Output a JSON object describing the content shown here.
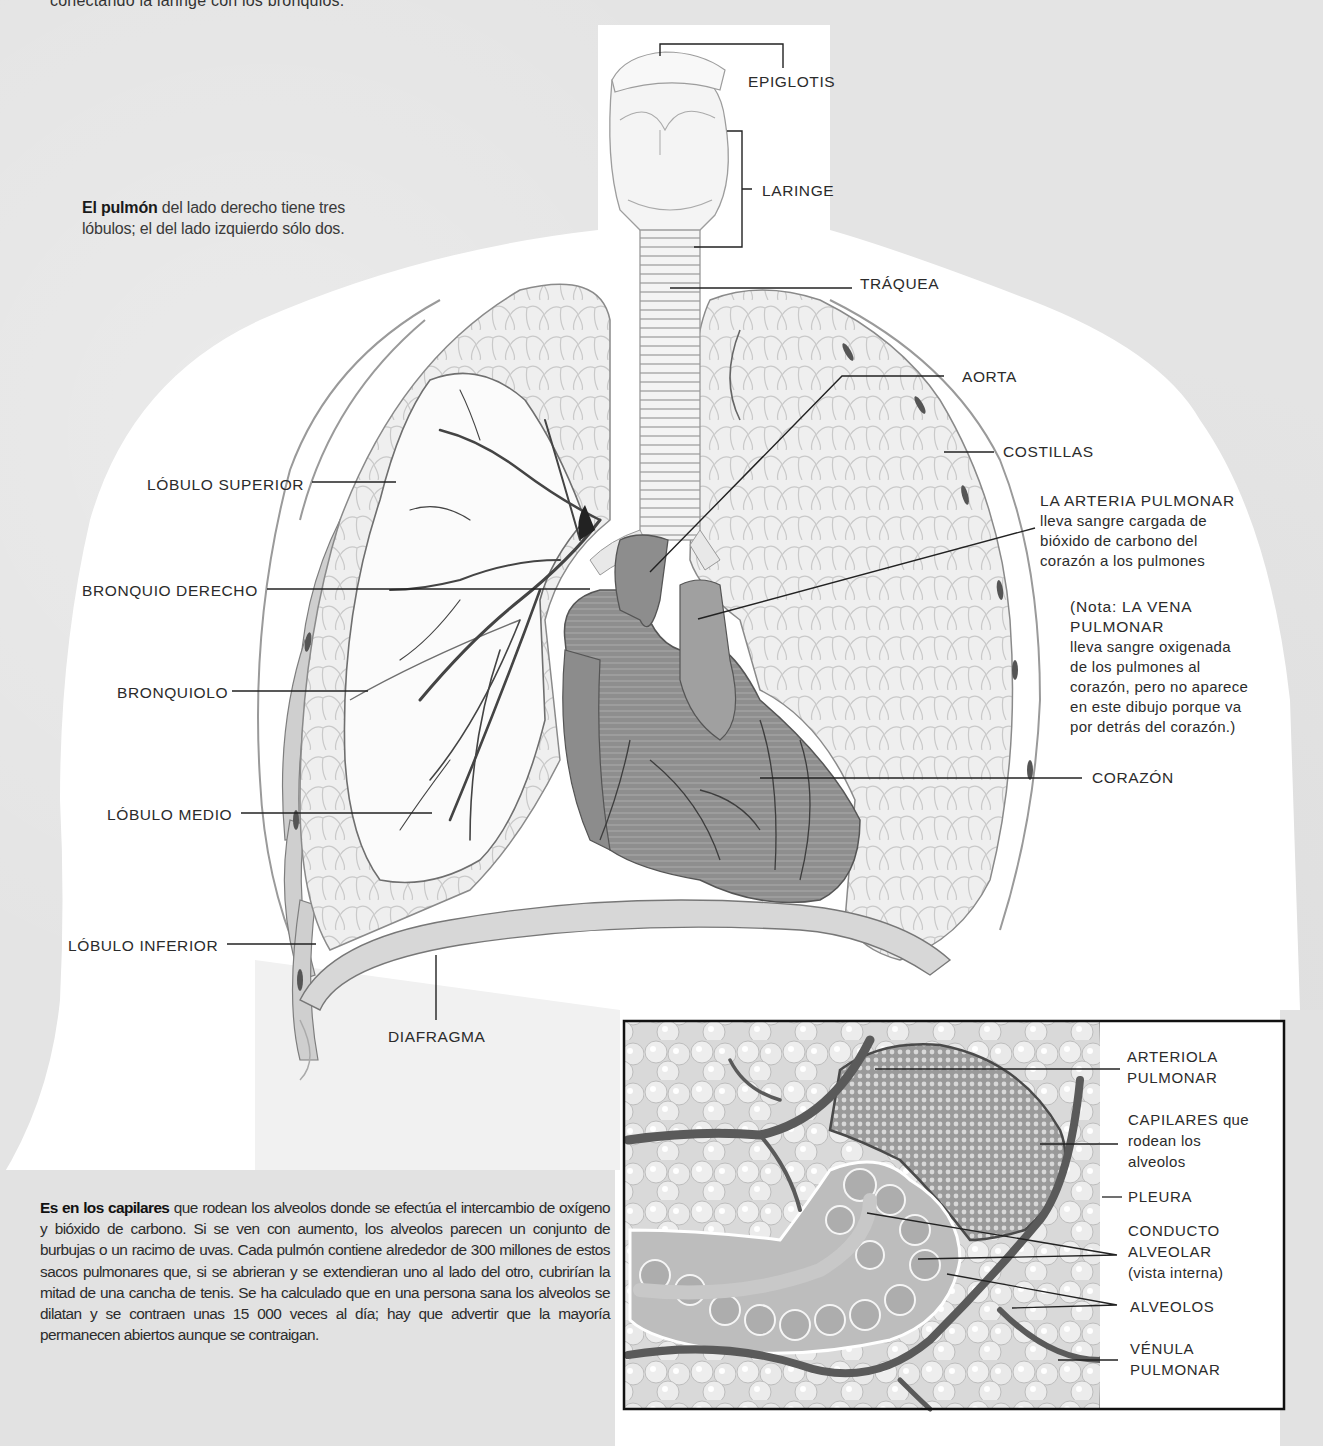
{
  "page": {
    "top_cut_text": "conectando la laringe con los bronquios.",
    "background_color": "#e4e4e4",
    "silhouette_color": "#ffffff"
  },
  "intro": {
    "bold": "El pulmón",
    "rest": " del lado derecho tiene tres lóbulos; el del lado izquierdo sólo dos."
  },
  "main_labels": {
    "epiglotis": "EPIGLOTIS",
    "laringe": "LARINGE",
    "traquea": "TRÁQUEA",
    "aorta": "AORTA",
    "costillas": "COSTILLAS",
    "arteria_pulmonar": {
      "title": "LA ARTERIA PULMONAR",
      "line1": "lleva sangre cargada de",
      "line2": "bióxido de carbono del",
      "line3": "corazón a los pulmones"
    },
    "vena_note": {
      "line1": "(Nota: LA VENA",
      "line2": "PULMONAR",
      "line3": "lleva sangre oxigenada",
      "line4": "de los pulmones al",
      "line5": "corazón, pero no aparece",
      "line6": "en este dibujo porque va",
      "line7": "por detrás del corazón.)"
    },
    "corazon": "CORAZÓN",
    "lobulo_superior": "LÓBULO SUPERIOR",
    "bronquio_derecho": "BRONQUIO DERECHO",
    "bronquiolo": "BRONQUIOLO",
    "lobulo_medio": "LÓBULO MEDIO",
    "lobulo_inferior": "LÓBULO INFERIOR",
    "diafragma": "DIAFRAGMA"
  },
  "inset": {
    "labels": {
      "arteriola_1": "ARTERIOLA",
      "arteriola_2": "PULMONAR",
      "capilares_1": "CAPILARES",
      "capilares_1b": " que",
      "capilares_2": "rodean los",
      "capilares_3": "alveolos",
      "pleura": "PLEURA",
      "conducto_1": "CONDUCTO",
      "conducto_2": "ALVEOLAR",
      "conducto_3": "(vista interna)",
      "alveolos": "ALVEOLOS",
      "venula_1": "VÉNULA",
      "venula_2": "PULMONAR"
    }
  },
  "paragraph": {
    "bold": "Es en los capilares",
    "rest": " que rodean los alveolos donde se efectúa el intercambio de oxígeno y bióxido de carbono. Si se ven con aumento, los alveolos parecen un conjunto de burbujas o un racimo de uvas. Cada pulmón contiene alrededor de 300 millones de estos sacos pulmonares que, si se abrieran y se extendieran uno al lado del otro, cubrirían la mitad de una cancha de tenis. Se ha calculado que en una persona sana los alveolos se dilatan y se contraen unas 15 000 veces al día; hay que advertir que la mayoría permanecen abiertos aunque se contraigan."
  }
}
